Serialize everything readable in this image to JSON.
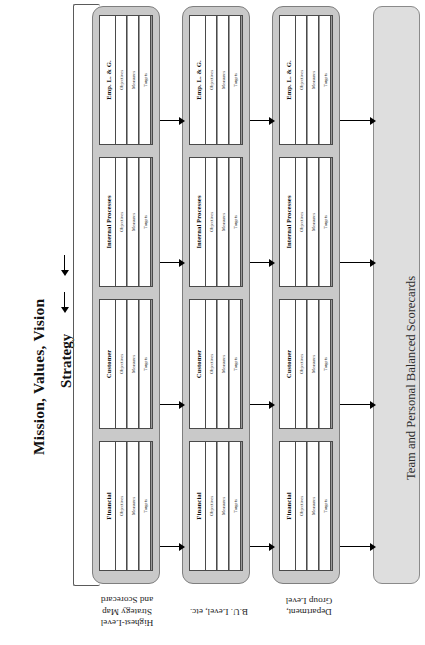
{
  "diagram": {
    "left_headings": {
      "mission": "Mission, Values, Vision",
      "strategy": "Strategy"
    },
    "scorecard_columns": [
      "Objectives",
      "Measures",
      "Targets",
      "Initiatives"
    ],
    "perspectives": [
      "Emp. L. & G.",
      "Internal Processes",
      "Customer",
      "Financial"
    ],
    "levels": [
      {
        "caption": "Highest-Level\nStrategy Map\nand Scorecard"
      },
      {
        "caption": "B.U. Level, etc."
      },
      {
        "caption": "Department,\nGroup Level"
      }
    ],
    "right_panel": {
      "label": "Team and Personal Balanced Scorecards"
    },
    "colors": {
      "panel_fill": "#c9c9c9",
      "panel_border": "#7e7e7e",
      "right_panel_fill": "#dedede",
      "card_fill": "#ffffff",
      "card_border": "#4a4a4a",
      "grid_line": "#b4b4b4",
      "arrow": "#000000",
      "text": "#1a1a1a"
    }
  }
}
